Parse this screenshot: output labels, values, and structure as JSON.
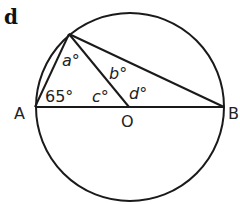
{
  "diagram": {
    "part_label": "d",
    "points": {
      "A": "A",
      "B": "B",
      "O": "O"
    },
    "angles": {
      "a": "a°",
      "b": "b°",
      "c": "c°",
      "d": "d°",
      "given": "65°"
    }
  }
}
